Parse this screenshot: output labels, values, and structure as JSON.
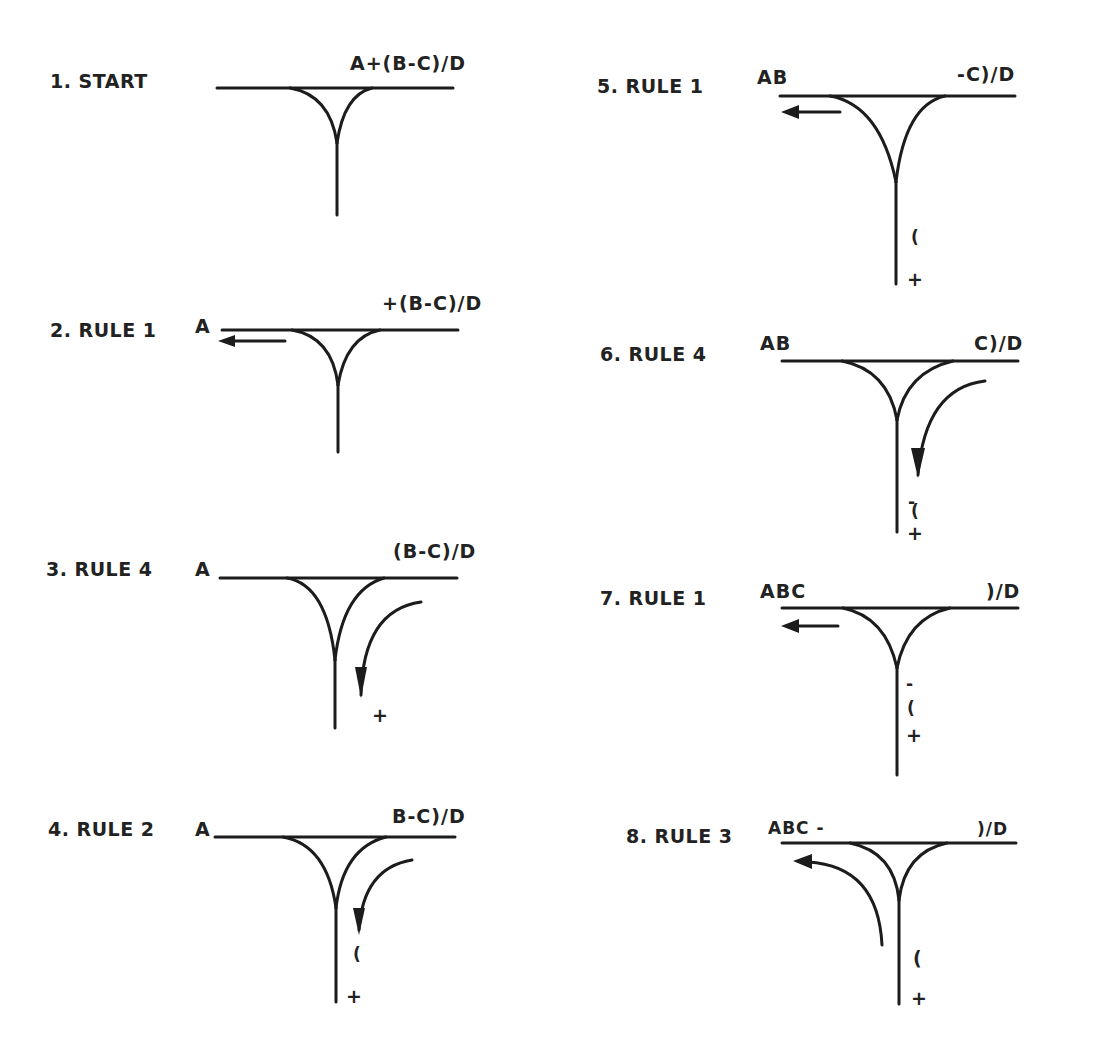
{
  "panels": [
    {
      "id": 1,
      "label": "1. START",
      "output": "",
      "input": "A+(B-C)/D",
      "stack": [],
      "move": "none"
    },
    {
      "id": 2,
      "label": "2. RULE 1",
      "output": "A",
      "input": "+(B-C)/D",
      "stack": [],
      "move": "input-to-output"
    },
    {
      "id": 3,
      "label": "3. RULE 4",
      "output": "A",
      "input": "(B-C)/D",
      "stack": [
        "+"
      ],
      "move": "input-to-stack"
    },
    {
      "id": 4,
      "label": "4. RULE 2",
      "output": "A",
      "input": "B-C)/D",
      "stack": [
        "(",
        "+"
      ],
      "move": "input-to-stack"
    },
    {
      "id": 5,
      "label": "5. RULE 1",
      "output": "AB",
      "input": "-C)/D",
      "stack": [
        "(",
        "+"
      ],
      "move": "input-to-output"
    },
    {
      "id": 6,
      "label": "6. RULE 4",
      "output": "AB",
      "input": "C)/D",
      "stack": [
        "-",
        "(",
        "+"
      ],
      "move": "input-to-stack"
    },
    {
      "id": 7,
      "label": "7. RULE 1",
      "output": "ABC",
      "input": ")/D",
      "stack": [
        "-",
        "(",
        "+"
      ],
      "move": "input-to-output"
    },
    {
      "id": 8,
      "label": "8. RULE 3",
      "output": "ABC -",
      "input": ")/D",
      "stack": [
        "(",
        "+"
      ],
      "move": "stack-to-output"
    }
  ],
  "colors": {
    "ink": "#1c1c1c",
    "background": "#ffffff"
  }
}
